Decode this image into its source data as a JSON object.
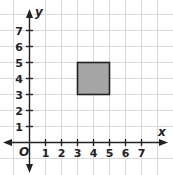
{
  "diagram": {
    "type": "coordinate-plane",
    "x_axis_label": "x",
    "y_axis_label": "y",
    "origin_label": "O",
    "x_ticks": [
      "1",
      "2",
      "3",
      "4",
      "5",
      "6",
      "7"
    ],
    "y_ticks": [
      "1",
      "2",
      "3",
      "4",
      "5",
      "6",
      "7"
    ],
    "shape": {
      "kind": "square",
      "vertices": [
        [
          3,
          3
        ],
        [
          5,
          3
        ],
        [
          5,
          5
        ],
        [
          3,
          5
        ]
      ],
      "fill_color": "#a6a6a6",
      "stroke_color": "#222222"
    },
    "grid_color": "#d9d9d9",
    "axis_color": "#222222"
  }
}
